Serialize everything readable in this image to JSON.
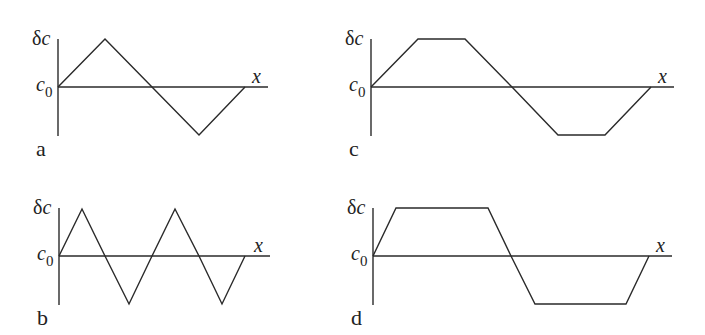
{
  "figure": {
    "y_axis_label": "δc",
    "baseline_label": "c₀",
    "x_axis_label": "x",
    "stroke_color": "#2a2a2a",
    "background": "#ffffff"
  },
  "panels": [
    {
      "id": "a",
      "label": "a",
      "shape": "triangle wave, one period",
      "origin": [
        58,
        87
      ],
      "axis_top": 39,
      "axis_bottom": 136,
      "axis_right": 268,
      "points": [
        [
          58,
          87
        ],
        [
          105,
          39
        ],
        [
          152,
          87
        ],
        [
          199,
          135
        ],
        [
          245,
          87
        ]
      ]
    },
    {
      "id": "b",
      "label": "b",
      "shape": "triangle wave, two periods",
      "origin": [
        59,
        256
      ],
      "axis_top": 208,
      "axis_bottom": 305,
      "axis_right": 270,
      "points": [
        [
          59,
          256
        ],
        [
          82,
          209
        ],
        [
          105,
          256
        ],
        [
          129,
          304
        ],
        [
          152,
          256
        ],
        [
          175,
          209
        ],
        [
          199,
          256
        ],
        [
          222,
          304
        ],
        [
          245,
          256
        ]
      ]
    },
    {
      "id": "c",
      "label": "c",
      "shape": "trapezoidal wave, one period",
      "origin": [
        371,
        87
      ],
      "axis_top": 39,
      "axis_bottom": 136,
      "axis_right": 674,
      "points": [
        [
          371,
          87
        ],
        [
          418,
          39
        ],
        [
          465,
          39
        ],
        [
          512,
          87
        ],
        [
          558,
          135
        ],
        [
          605,
          135
        ],
        [
          651,
          87
        ]
      ]
    },
    {
      "id": "d",
      "label": "d",
      "shape": "trapezoidal wave with wide plateaus, one period",
      "origin": [
        373,
        256
      ],
      "axis_top": 208,
      "axis_bottom": 305,
      "axis_right": 672,
      "points": [
        [
          373,
          256
        ],
        [
          396,
          208
        ],
        [
          488,
          208
        ],
        [
          511,
          256
        ],
        [
          535,
          304
        ],
        [
          626,
          304
        ],
        [
          649,
          256
        ]
      ]
    }
  ]
}
